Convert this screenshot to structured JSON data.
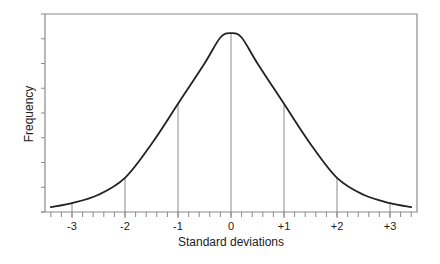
{
  "chart_data": {
    "type": "line",
    "title": "",
    "xlabel": "Standard deviations",
    "ylabel": "Frequency",
    "xlim": [
      -3.45,
      3.5
    ],
    "ylim": [
      0,
      8
    ],
    "grid": false,
    "legend": null,
    "x_ticks": [
      -3,
      -2,
      -1,
      0,
      1,
      2,
      3
    ],
    "x_tick_labels": [
      "-3",
      "-2",
      "-1",
      "0",
      "+1",
      "+2",
      "+3"
    ],
    "x_minor_tick_step": 0.2,
    "y_tick_count": 8,
    "y_tick_labels": [],
    "vertical_reference_lines_at": [
      -2,
      -1,
      0,
      1,
      2
    ],
    "series": [
      {
        "name": "distribution curve",
        "x": [
          -3.4,
          -3.0,
          -2.5,
          -2.0,
          -1.5,
          -1.0,
          -0.5,
          -0.2,
          0,
          0.2,
          0.5,
          1.0,
          1.5,
          2.0,
          2.5,
          3.0,
          3.4
        ],
        "y": [
          0.2,
          0.36,
          0.7,
          1.38,
          2.75,
          4.37,
          6.0,
          7.05,
          7.23,
          7.05,
          6.0,
          4.37,
          2.75,
          1.38,
          0.7,
          0.36,
          0.2
        ]
      }
    ],
    "annotations": []
  }
}
